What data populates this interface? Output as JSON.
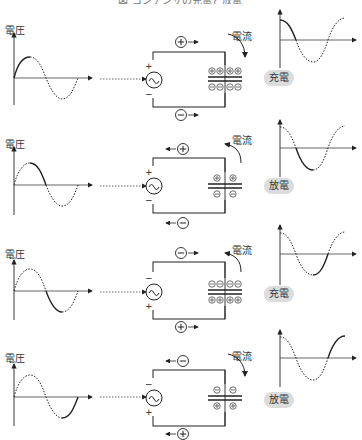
{
  "title": "図 コンデンサの充電と放電",
  "rows": [
    {
      "voltage_label": "電圧",
      "current_label": "電流",
      "state_badge": "充電",
      "top_charge": "+",
      "bottom_charge": "−",
      "flow_direction": "right",
      "source_top_sign": "+",
      "source_bottom_sign": "−",
      "plate_top_charges": [
        "+",
        "+",
        "+",
        "+"
      ],
      "plate_bottom_charges": [
        "−",
        "−",
        "−",
        "−"
      ],
      "highlighted_segment": "0 to 90°"
    },
    {
      "voltage_label": "電圧",
      "current_label": "電流",
      "state_badge": "放電",
      "top_charge": "+",
      "bottom_charge": "−",
      "flow_direction": "left",
      "source_top_sign": "+",
      "source_bottom_sign": "−",
      "plate_top_charges": [
        "+",
        "+"
      ],
      "plate_bottom_charges": [
        "−",
        "−"
      ],
      "highlighted_segment": "90° to 180°"
    },
    {
      "voltage_label": "電圧",
      "current_label": "電流",
      "state_badge": "充電",
      "top_charge": "−",
      "bottom_charge": "+",
      "flow_direction": "right",
      "source_top_sign": "−",
      "source_bottom_sign": "+",
      "plate_top_charges": [
        "−",
        "−",
        "−",
        "−"
      ],
      "plate_bottom_charges": [
        "+",
        "+",
        "+",
        "+"
      ],
      "highlighted_segment": "180° to 270°"
    },
    {
      "voltage_label": "電圧",
      "current_label": "電流",
      "state_badge": "放電",
      "top_charge": "−",
      "bottom_charge": "+",
      "flow_direction": "left",
      "source_top_sign": "−",
      "source_bottom_sign": "+",
      "plate_top_charges": [
        "−",
        "−"
      ],
      "plate_bottom_charges": [
        "+",
        "+"
      ],
      "highlighted_segment": "270° to 360°"
    }
  ],
  "colors": {
    "line": "#222222",
    "badge_bg": "#dcdcdc",
    "text": "#333333"
  }
}
